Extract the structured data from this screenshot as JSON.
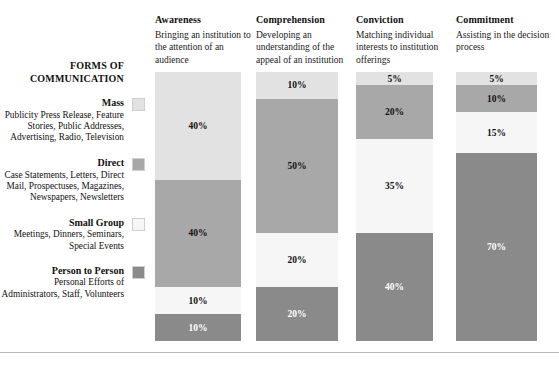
{
  "sidebar": {
    "title": "FORMS OF COMMUNICATION",
    "items": [
      {
        "name": "Mass",
        "description": "Publicity Press Release, Feature Stories, Public Addresses, Advertising, Radio, Television",
        "color": "#e2e2e2",
        "swatch": "mass-swatch"
      },
      {
        "name": "Direct",
        "description": "Case Statements, Letters, Direct Mail, Prospectuses, Magazines, Newspapers, Newsletters",
        "color": "#a8a8a8",
        "swatch": "direct-swatch"
      },
      {
        "name": "Small Group",
        "description": "Meetings, Dinners, Seminars, Special Events",
        "color": "#f6f6f6",
        "swatch": "small-group-swatch"
      },
      {
        "name": "Person to Person",
        "description": "Personal Efforts of Administrators, Staff, Volunteers",
        "color": "#8a8a8a",
        "swatch": "person-to-person-swatch"
      }
    ]
  },
  "columns": [
    {
      "title": "Awareness",
      "description": "Bringing an institution to the attention of an audience"
    },
    {
      "title": "Comprehension",
      "description": "Developing an understanding of the appeal of an institution"
    },
    {
      "title": "Conviction",
      "description": "Matching individual interests to institution offerings"
    },
    {
      "title": "Commitment",
      "description": "Assisting in the decision process"
    }
  ],
  "chart_data": {
    "type": "bar",
    "title": "",
    "xlabel": "",
    "ylabel": "",
    "ylim": [
      0,
      100
    ],
    "stacked": true,
    "grid": false,
    "legend_position": "left",
    "categories": [
      "Awareness",
      "Comprehension",
      "Conviction",
      "Commitment"
    ],
    "series": [
      {
        "name": "Mass",
        "color": "#e2e2e2",
        "values": [
          40,
          10,
          5,
          5
        ],
        "labels": [
          "40%",
          "10%",
          "5%",
          "5%"
        ]
      },
      {
        "name": "Direct",
        "color": "#a8a8a8",
        "values": [
          40,
          50,
          20,
          10
        ],
        "labels": [
          "40%",
          "50%",
          "20%",
          "10%"
        ]
      },
      {
        "name": "Small Group",
        "color": "#f6f6f6",
        "values": [
          10,
          20,
          35,
          15
        ],
        "labels": [
          "10%",
          "20%",
          "35%",
          "15%"
        ]
      },
      {
        "name": "Person to Person",
        "color": "#8a8a8a",
        "values": [
          10,
          20,
          40,
          70
        ],
        "labels": [
          "10%",
          "20%",
          "40%",
          "70%"
        ]
      }
    ]
  }
}
